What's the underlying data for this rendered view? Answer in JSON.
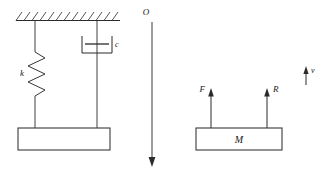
{
  "figure": {
    "background_color": "#ffffff",
    "line_color": "#2b2b2b"
  },
  "left_system": {
    "name": "spring-mass-damper-system",
    "support": {
      "label": "fixed-support-hatching",
      "hatch_count": 13
    },
    "spring": {
      "symbol_label": "k",
      "coil_peaks": 4
    },
    "damper": {
      "symbol_label": "c"
    },
    "mass_block": {
      "label": ""
    }
  },
  "axis": {
    "origin_label": "O",
    "direction": "downward",
    "name": "vertical-displacement-axis"
  },
  "free_body_diagram": {
    "name": "free-body-diagram",
    "mass_label": "M",
    "forces": [
      {
        "label": "F",
        "direction": "up",
        "label_side": "left"
      },
      {
        "label": "R",
        "direction": "up",
        "label_side": "right"
      }
    ],
    "velocity": {
      "label": "v",
      "direction": "up",
      "label_side": "right"
    }
  }
}
